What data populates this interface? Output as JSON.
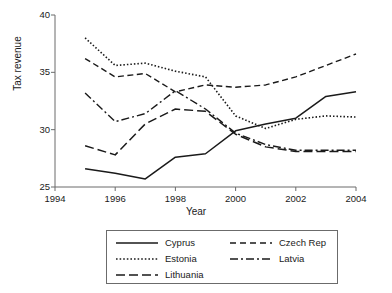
{
  "chart_data": {
    "type": "line",
    "title": "",
    "xlabel": "Year",
    "ylabel": "Tax revenue",
    "xlim": [
      1994,
      2004
    ],
    "ylim": [
      25,
      40
    ],
    "xticks": [
      1994,
      1996,
      1998,
      2000,
      2002,
      2004
    ],
    "yticks": [
      25,
      30,
      35,
      40
    ],
    "grid": false,
    "legend_position": "below-plot",
    "x": [
      1995,
      1996,
      1997,
      1998,
      1999,
      2000,
      2001,
      2002,
      2003,
      2004
    ],
    "series": [
      {
        "name": "Cyprus",
        "style": "solid",
        "values": [
          26.6,
          26.2,
          25.7,
          27.6,
          27.9,
          29.9,
          30.5,
          31.0,
          32.9,
          33.3
        ]
      },
      {
        "name": "Czech Rep",
        "style": "dashed",
        "values": [
          36.2,
          34.6,
          34.9,
          33.3,
          33.9,
          33.7,
          33.9,
          34.6,
          35.6,
          36.6
        ]
      },
      {
        "name": "Estonia",
        "style": "dotted",
        "values": [
          38.0,
          35.6,
          35.8,
          35.1,
          34.6,
          31.2,
          30.1,
          30.9,
          31.2,
          31.1
        ]
      },
      {
        "name": "Latvia",
        "style": "dashdot",
        "values": [
          33.2,
          30.7,
          31.4,
          33.4,
          31.8,
          29.7,
          28.7,
          28.2,
          28.2,
          28.2
        ]
      },
      {
        "name": "Lithuania",
        "style": "longdash",
        "values": [
          28.6,
          27.8,
          30.5,
          31.8,
          31.6,
          29.6,
          28.5,
          28.1,
          28.1,
          28.1
        ]
      }
    ]
  },
  "axis": {
    "ylabel": "Tax revenue",
    "xlabel": "Year",
    "ytick_labels": [
      "40",
      "35",
      "30",
      "25"
    ],
    "xtick_labels": [
      "1994",
      "1996",
      "1998",
      "2000",
      "2002",
      "2004"
    ]
  },
  "legend": {
    "entries": [
      {
        "label": "Cyprus",
        "style": "solid"
      },
      {
        "label": "Czech Rep",
        "style": "dashed"
      },
      {
        "label": "Estonia",
        "style": "dotted"
      },
      {
        "label": "Latvia",
        "style": "dashdot"
      },
      {
        "label": "Lithuania",
        "style": "longdash"
      }
    ]
  },
  "colors": {
    "line": "#1a1a1a",
    "axis": "#6b6b6b",
    "background": "#ffffff",
    "legend_border": "#6b6b6b"
  }
}
